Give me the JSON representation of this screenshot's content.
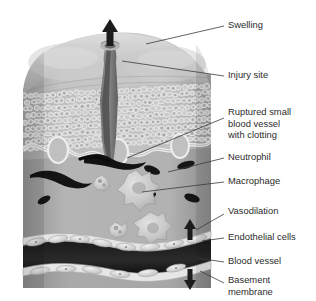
{
  "figure": {
    "background_color": "#ffffff",
    "text_color": "#2c2c2c",
    "leader_color": "#3a3a3a",
    "style": "grayscale medical illustration"
  },
  "labels": [
    {
      "id": "swelling",
      "name": "label-swelling",
      "lines": [
        "Swelling"
      ],
      "text_x": 228,
      "text_y": 26,
      "leader": "M224,26 L146,44",
      "points_to": "upward arrow at apex of swollen skin dome"
    },
    {
      "id": "injury-site",
      "name": "label-injury-site",
      "lines": [
        "Injury site"
      ],
      "text_x": 228,
      "text_y": 76,
      "leader": "M224,76 L122,61",
      "points_to": "wound channel opening at skin surface"
    },
    {
      "id": "ruptured-vessel",
      "name": "label-ruptured-small-blood-vessel-with-clotting",
      "lines": [
        "Ruptured small",
        "blood vessel",
        "with clotting"
      ],
      "text_x": 228,
      "text_y": 113,
      "leader": "M224,118 L127,158",
      "points_to": "dark clotted vessel beneath epidermis at wound base"
    },
    {
      "id": "neutrophil",
      "name": "label-neutrophil",
      "lines": [
        "Neutrophil"
      ],
      "text_x": 228,
      "text_y": 158,
      "leader": "M224,158 L168,172",
      "points_to": "dark elongated bean-shaped cell in dermis"
    },
    {
      "id": "macrophage",
      "name": "label-macrophage",
      "lines": [
        "Macrophage"
      ],
      "text_x": 228,
      "text_y": 182,
      "leader": "M224,182 L142,192",
      "points_to": "star-shaped amoeboid cell with pseudopods"
    },
    {
      "id": "vasodilation",
      "name": "label-vasodilation",
      "lines": [
        "Vasodilation"
      ],
      "text_x": 228,
      "text_y": 212,
      "leader": "M224,214 L196,230",
      "points_to": "opposing vertical arrows across blood vessel"
    },
    {
      "id": "endothelial-cells",
      "name": "label-endothelial-cells",
      "lines": [
        "Endothelial cells"
      ],
      "text_x": 228,
      "text_y": 238,
      "leader": "M224,238 L202,241",
      "points_to": "pale cells lining the vessel wall"
    },
    {
      "id": "blood-vessel",
      "name": "label-blood-vessel",
      "lines": [
        "Blood vessel"
      ],
      "text_x": 228,
      "text_y": 262,
      "leader": "M224,262 L197,258",
      "points_to": "dark wavy vessel lumen"
    },
    {
      "id": "basement-membrane",
      "name": "label-basement-membrane",
      "lines": [
        "Basement",
        "membrane"
      ],
      "text_x": 228,
      "text_y": 281,
      "leader": "M224,283 L200,271",
      "points_to": "pale band beneath endothelium"
    }
  ],
  "structures": {
    "swelling_arrow": {
      "name": "swelling-arrow",
      "direction": "up",
      "x": 113,
      "y": 22
    },
    "vasodilation_arrow_up": {
      "name": "vasodilation-arrow-up",
      "direction": "up",
      "x": 190,
      "y": 224
    },
    "vasodilation_arrow_down": {
      "name": "vasodilation-arrow-down",
      "direction": "down",
      "x": 190,
      "y": 276
    },
    "epidermis": {
      "name": "epidermis-layer",
      "description": "cobblestone keratinocyte cells"
    },
    "dermis": {
      "name": "dermis-layer",
      "description": "smooth gray connective tissue"
    },
    "wound_channel": {
      "name": "injury-channel",
      "description": "dark tapering wound tract"
    }
  },
  "counts": {
    "neutrophils": 6,
    "macrophages": 4,
    "endothelial_cells": 12
  }
}
